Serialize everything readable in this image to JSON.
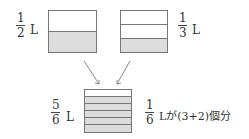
{
  "containers": [
    {
      "id": "half",
      "label": {
        "numerator": "1",
        "denominator": "2",
        "unit": "L"
      },
      "rows": 2,
      "shaded_rows": 1
    },
    {
      "id": "third",
      "label": {
        "numerator": "1",
        "denominator": "3",
        "unit": "L"
      },
      "rows": 3,
      "shaded_rows": 1
    },
    {
      "id": "sum",
      "label": {
        "numerator": "5",
        "denominator": "6",
        "unit": "L"
      },
      "rows": 6,
      "shaded_rows": 5
    }
  ],
  "caption": {
    "numerator": "1",
    "denominator": "6",
    "text": "Lが(3+2)個分"
  },
  "colors": {
    "shade": "#dcdcdc",
    "line": "#777777",
    "arrow": "#888888"
  }
}
